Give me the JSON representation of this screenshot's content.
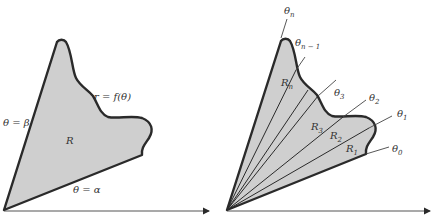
{
  "colors": {
    "fill": "#cfcfcf",
    "stroke": "#2a2a2a",
    "text": "#333333",
    "background": "#ffffff"
  },
  "left_figure": {
    "curve_label": "r = f(θ)",
    "upper_ray_label": "θ = β",
    "lower_ray_label": "θ = α",
    "region_label": "R"
  },
  "right_figure": {
    "ray_labels": {
      "theta_n": {
        "base": "θ",
        "sub": "n"
      },
      "theta_n_minus_1": {
        "base": "θ",
        "sub": "n − 1"
      },
      "theta_3": {
        "base": "θ",
        "sub": "3"
      },
      "theta_2": {
        "base": "θ",
        "sub": "2"
      },
      "theta_1": {
        "base": "θ",
        "sub": "1"
      },
      "theta_0": {
        "base": "θ",
        "sub": "0"
      }
    },
    "region_labels": {
      "R_n": {
        "base": "R",
        "sub": "n"
      },
      "R_3": {
        "base": "R",
        "sub": "3"
      },
      "R_2": {
        "base": "R",
        "sub": "2"
      },
      "R_1": {
        "base": "R",
        "sub": "1"
      }
    }
  }
}
